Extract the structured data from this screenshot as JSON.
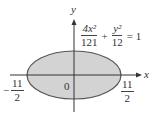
{
  "diagram": {
    "type": "ellipse-plot",
    "axes": {
      "x_label": "x",
      "y_label": "y",
      "origin_label": "0"
    },
    "equation": {
      "term1_num": "4x²",
      "term1_den": "121",
      "plus": "+",
      "term2_num": "y²",
      "term2_den": "12",
      "equals": "= 1"
    },
    "intercepts": {
      "left": {
        "sign": "−",
        "num": "11",
        "den": "2"
      },
      "right": {
        "num": "11",
        "den": "2"
      }
    },
    "colors": {
      "fill": "#d3d3d3",
      "stroke": "#555555",
      "axis": "#333333"
    }
  }
}
